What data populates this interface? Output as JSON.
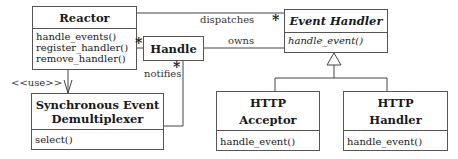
{
  "classes": {
    "reactor": {
      "name": "Reactor",
      "operations": [
        "handle_events()",
        "register_handler()",
        "remove_handler()"
      ]
    },
    "handle": {
      "name": "Handle"
    },
    "event_handler": {
      "name": "Event Handler",
      "abstract": true,
      "operations": [
        "handle_event()"
      ]
    },
    "sync_demux": {
      "name_line1": "Synchronous Event",
      "name_line2": "Demultiplexer",
      "operations": [
        "select()"
      ]
    },
    "http_acceptor": {
      "name_line1": "HTTP",
      "name_line2": "Acceptor",
      "operations": [
        "handle_event()"
      ]
    },
    "http_handler": {
      "name_line1": "HTTP",
      "name_line2": "Handler",
      "operations": [
        "handle_event()"
      ]
    }
  },
  "relations": {
    "dispatches": {
      "label": "dispatches",
      "multiplicity": "*"
    },
    "owns": {
      "label": "owns",
      "multiplicity": "*"
    },
    "notifies": {
      "label": "notifies",
      "multiplicity": "*"
    },
    "uses": {
      "label": "<<use>>"
    }
  }
}
